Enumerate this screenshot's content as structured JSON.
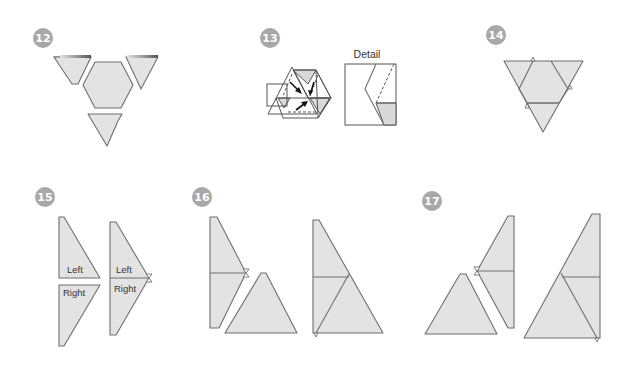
{
  "steps": [
    {
      "number": "12",
      "badge": {
        "cx": 43,
        "cy": 38
      }
    },
    {
      "number": "13",
      "badge": {
        "cx": 270,
        "cy": 38
      },
      "detail_label": "Detail"
    },
    {
      "number": "14",
      "badge": {
        "cx": 496,
        "cy": 35
      }
    },
    {
      "number": "15",
      "badge": {
        "cx": 45,
        "cy": 197
      },
      "labels": {
        "left_1": "Left",
        "right_1": "Right",
        "left_2": "Left",
        "right_2": "Right"
      }
    },
    {
      "number": "16",
      "badge": {
        "cx": 202,
        "cy": 197
      }
    },
    {
      "number": "17",
      "badge": {
        "cx": 432,
        "cy": 201
      }
    }
  ],
  "colors": {
    "piece_fill": "#e3e3e3",
    "piece_stroke": "#6f6f6f",
    "badge_fill": "#a8a8a8",
    "badge_text": "#ffffff"
  }
}
